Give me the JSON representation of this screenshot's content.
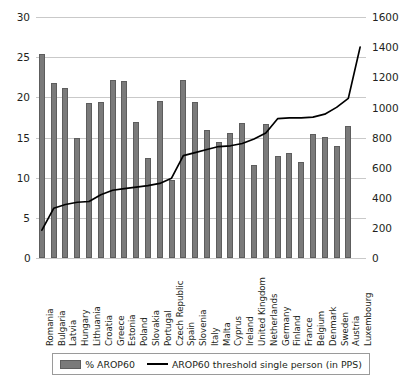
{
  "chart_data": {
    "type": "bar",
    "title": "",
    "subtitle": "",
    "xlabel": "",
    "ylabel": "",
    "y2label": "",
    "grid": true,
    "legend_position": "bottom",
    "ylim": [
      0,
      30
    ],
    "y2lim": [
      0,
      1600
    ],
    "yticks": [
      "0",
      "5",
      "10",
      "15",
      "20",
      "25",
      "30"
    ],
    "y2ticks": [
      "0",
      "200",
      "400",
      "600",
      "800",
      "1000",
      "1200",
      "1400",
      "1600"
    ],
    "categories": [
      "Romania",
      "Bulgaria",
      "Latvia",
      "Hungary",
      "Lithuania",
      "Croatia",
      "Greece",
      "Estonia",
      "Poland",
      "Slovakia",
      "Portugal",
      "Czech Republic",
      "Spain",
      "Slovenia",
      "Italy",
      "Malta",
      "Cyprus",
      "Ireland",
      "United Kingdom",
      "Netherlands",
      "Germany",
      "Finland",
      "France",
      "Belgium",
      "Denmark",
      "Sweden",
      "Austria",
      "Luxembourg"
    ],
    "series": [
      {
        "name": "% AROP60",
        "type": "bar",
        "axis": "left",
        "color": "#7a7a7a",
        "values": [
          25.4,
          21.8,
          21.2,
          15.0,
          19.3,
          19.4,
          22.2,
          22.0,
          16.9,
          12.5,
          19.5,
          9.7,
          22.2,
          19.4,
          15.9,
          14.4,
          15.5,
          16.8,
          11.6,
          16.7,
          12.7,
          13.1,
          11.9,
          15.4,
          15.1,
          14.0,
          16.4,
          0.0
        ]
      },
      {
        "name": "AROP60 threshold single person (in PPS)",
        "type": "line",
        "axis": "right",
        "color": "#000000",
        "values": [
          185,
          330,
          355,
          370,
          375,
          420,
          450,
          460,
          470,
          480,
          495,
          530,
          680,
          700,
          720,
          740,
          745,
          760,
          790,
          830,
          925,
          930,
          930,
          935,
          955,
          1000,
          1060,
          1400
        ]
      }
    ]
  },
  "legend": {
    "items": [
      {
        "label": "% AROP60",
        "marker": "bar-swatch"
      },
      {
        "label": "AROP60 threshold single person (in PPS)",
        "marker": "line-swatch"
      }
    ]
  },
  "axes": {
    "left_zero": "0",
    "right_zero": "0"
  }
}
